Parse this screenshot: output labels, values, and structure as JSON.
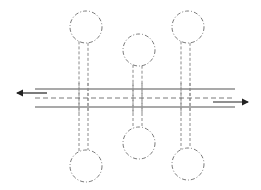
{
  "diagram": {
    "type": "schematic",
    "colors": {
      "rail": "#8c8c8c",
      "outline": "#7a7a7a",
      "arrow": "#222222",
      "background": "#ffffff"
    },
    "rails": {
      "top_solid_y": 89,
      "center_dashed_y": 98,
      "bottom_solid_y": 107,
      "x_start": 35,
      "x_end": 235
    },
    "arrows": [
      {
        "direction": "left",
        "y": 93,
        "x_from": 47,
        "x_to": 17
      },
      {
        "direction": "right",
        "y": 102,
        "x_from": 213,
        "x_to": 248
      }
    ],
    "branches_top": [
      {
        "cx": 86,
        "cy": 27,
        "r": 16,
        "stem_x": [
          79,
          88
        ]
      },
      {
        "cx": 139,
        "cy": 50,
        "r": 16,
        "stem_x": [
          133,
          142
        ]
      },
      {
        "cx": 188,
        "cy": 27,
        "r": 16,
        "stem_x": [
          181,
          190
        ]
      }
    ],
    "branches_bottom": [
      {
        "cx": 86,
        "cy": 166,
        "r": 16,
        "stem_x": [
          79,
          88
        ]
      },
      {
        "cx": 139,
        "cy": 143,
        "r": 16,
        "stem_x": [
          133,
          142
        ]
      },
      {
        "cx": 188,
        "cy": 164,
        "r": 16,
        "stem_x": [
          181,
          190
        ]
      }
    ]
  }
}
